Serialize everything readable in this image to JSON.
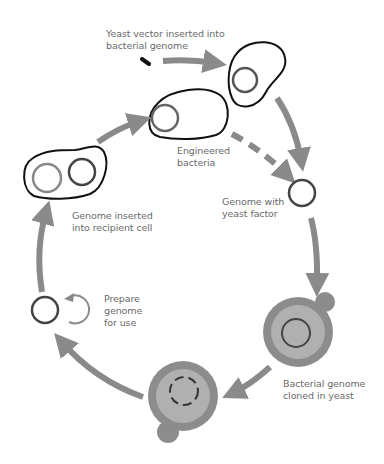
{
  "diagram": {
    "type": "cycle",
    "colors": {
      "arrow": "#8a8a8a",
      "cell_outline": "#111111",
      "genome_ring": "#555555",
      "yeast_outer": "#8c8c8c",
      "yeast_inner": "#b0b0b0",
      "text": "#6a6a6a"
    },
    "labels": {
      "yeast_vector": "Yeast vector inserted into\nbacterial genome",
      "engineered": "Engineered\nbacteria",
      "genome_yeast_factor": "Genome with\nyeast factor",
      "cloned_in_yeast": "Bacterial genome\ncloned in yeast",
      "prepare": "Prepare\ngenome\nfor use",
      "inserted_recipient": "Genome inserted\ninto recipient cell"
    },
    "steps": [
      "Yeast vector inserted into bacterial genome",
      "Engineered bacteria",
      "Genome with yeast factor",
      "Bacterial genome cloned in yeast",
      "Prepare genome for use",
      "Genome inserted into recipient cell"
    ]
  }
}
